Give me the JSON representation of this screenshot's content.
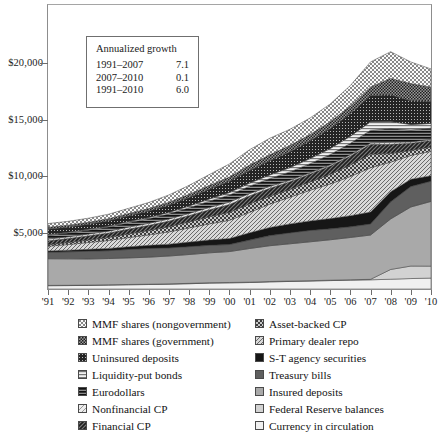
{
  "chart_data": {
    "type": "area",
    "stacked": true,
    "title": "",
    "xlabel": "",
    "ylabel": "",
    "ylim": [
      0,
      25000
    ],
    "ytick_values": [
      5000,
      10000,
      15000,
      20000
    ],
    "ytick_labels": [
      "$5,000",
      "$10,000",
      "$15,000",
      "$20,000"
    ],
    "grid": false,
    "legend_position": "below",
    "x": [
      1991,
      1992,
      1993,
      1994,
      1995,
      1996,
      1997,
      1998,
      1999,
      2000,
      2001,
      2002,
      2003,
      2004,
      2005,
      2006,
      2007,
      2008,
      2009,
      2010
    ],
    "xtick_labels": [
      "'91",
      "'92",
      "'93",
      "'94",
      "'95",
      "'96",
      "'97",
      "'98",
      "'99",
      "'00",
      "'01",
      "'02",
      "'03",
      "'04",
      "'05",
      "'06",
      "'07",
      "'08",
      "'09",
      "'10"
    ],
    "series": [
      {
        "name": "Currency in circulation",
        "pattern": "solid-white",
        "color": "#eeeeee",
        "values": [
          290,
          300,
          320,
          345,
          370,
          395,
          425,
          465,
          520,
          540,
          570,
          625,
          665,
          700,
          740,
          780,
          810,
          860,
          920,
          960
        ]
      },
      {
        "name": "Federal Reserve balances",
        "pattern": "solid-light-gray",
        "color": "#d0d0d0",
        "values": [
          25,
          25,
          25,
          28,
          28,
          28,
          30,
          32,
          35,
          35,
          35,
          35,
          35,
          35,
          35,
          35,
          40,
          860,
          1100,
          1050
        ]
      },
      {
        "name": "Insured deposits",
        "pattern": "solid-gray",
        "color": "#a8a8a8",
        "values": [
          2350,
          2330,
          2300,
          2310,
          2340,
          2380,
          2450,
          2540,
          2630,
          2720,
          2960,
          3150,
          3280,
          3420,
          3560,
          3720,
          3900,
          4450,
          5200,
          5700
        ]
      },
      {
        "name": "Treasury bills",
        "pattern": "solid-dark-gray",
        "color": "#5e5e5e",
        "values": [
          565,
          620,
          680,
          690,
          740,
          760,
          715,
          690,
          660,
          620,
          740,
          890,
          960,
          1000,
          960,
          940,
          970,
          1500,
          1800,
          1780
        ]
      },
      {
        "name": "S-T agency securities",
        "pattern": "solid-black",
        "color": "#1a1a1a",
        "values": [
          120,
          140,
          170,
          200,
          240,
          280,
          330,
          400,
          470,
          530,
          640,
          720,
          790,
          840,
          900,
          980,
          1050,
          900,
          640,
          480
        ]
      },
      {
        "name": "Primary dealer repo",
        "pattern": "diag-hatch-light",
        "color": "#cfcfcf",
        "values": [
          420,
          500,
          600,
          700,
          810,
          920,
          1080,
          1250,
          1420,
          1600,
          1800,
          2050,
          2350,
          2700,
          3050,
          3450,
          3900,
          2600,
          2100,
          2150
        ]
      },
      {
        "name": "Asset-backed CP",
        "pattern": "checker-medium",
        "color": "#b5b5b5",
        "values": [
          130,
          170,
          210,
          260,
          320,
          380,
          450,
          530,
          620,
          700,
          740,
          700,
          680,
          720,
          840,
          1000,
          1200,
          750,
          430,
          380
        ]
      },
      {
        "name": "Financial CP",
        "pattern": "diag-hatch-dark",
        "color": "#606060",
        "values": [
          350,
          360,
          380,
          400,
          430,
          460,
          500,
          560,
          620,
          690,
          720,
          700,
          680,
          700,
          740,
          800,
          870,
          820,
          640,
          570
        ]
      },
      {
        "name": "Nonfinancial CP",
        "pattern": "diag-hatch-xlight",
        "color": "#dcdcdc",
        "values": [
          150,
          150,
          155,
          160,
          170,
          180,
          185,
          190,
          200,
          215,
          200,
          165,
          130,
          110,
          110,
          115,
          120,
          180,
          120,
          100
        ]
      },
      {
        "name": "Eurodollars",
        "pattern": "hlines-dark",
        "color": "#4a4a4a",
        "values": [
          330,
          330,
          340,
          360,
          390,
          410,
          450,
          500,
          560,
          620,
          650,
          690,
          740,
          810,
          900,
          1000,
          1120,
          1200,
          1050,
          980
        ]
      },
      {
        "name": "Liquidity-put bonds",
        "pattern": "hlines-light",
        "color": "#dadada",
        "values": [
          60,
          65,
          70,
          80,
          95,
          110,
          130,
          155,
          185,
          220,
          265,
          315,
          375,
          445,
          530,
          630,
          750,
          620,
          480,
          420
        ]
      },
      {
        "name": "Uninsured deposits",
        "pattern": "dark-dot",
        "color": "#2b2b2b",
        "values": [
          480,
          460,
          450,
          470,
          510,
          560,
          640,
          740,
          860,
          990,
          1120,
          1260,
          1400,
          1560,
          1760,
          2000,
          2300,
          2350,
          2100,
          1950
        ]
      },
      {
        "name": "MMF shares (government)",
        "pattern": "checker-dark",
        "color": "#8a8a8a",
        "values": [
          160,
          165,
          170,
          180,
          195,
          215,
          245,
          285,
          330,
          380,
          470,
          520,
          540,
          560,
          600,
          660,
          760,
          1450,
          1500,
          1250
        ]
      },
      {
        "name": "MMF shares (nongovernment)",
        "pattern": "checker-light",
        "color": "#e6e6e6",
        "values": [
          330,
          340,
          360,
          400,
          460,
          540,
          650,
          790,
          960,
          1150,
          1350,
          1450,
          1430,
          1450,
          1560,
          1800,
          2200,
          2350,
          1900,
          1600
        ]
      }
    ]
  },
  "axes": {
    "y": {
      "ticks": [
        {
          "label": "$20,000",
          "value": 20000
        },
        {
          "label": "$15,000",
          "value": 15000
        },
        {
          "label": "$10,000",
          "value": 10000
        },
        {
          "label": "$5,000",
          "value": 5000
        }
      ]
    },
    "x": {
      "ticks": [
        "'91",
        "'92",
        "'93",
        "'94",
        "'95",
        "'96",
        "'97",
        "'98",
        "'99",
        "'00",
        "'01",
        "'02",
        "'03",
        "'04",
        "'05",
        "'06",
        "'07",
        "'08",
        "'09",
        "'10"
      ]
    }
  },
  "inset": {
    "title": "Annualized growth",
    "rows": [
      {
        "period": "1991–2007",
        "rate": "7.1"
      },
      {
        "period": "2007–2010",
        "rate": "0.1"
      },
      {
        "period": "1991–2010",
        "rate": "6.0"
      }
    ]
  },
  "legend": {
    "left": [
      {
        "label": "MMF shares (nongovernment)",
        "pattern": "checker-light",
        "icon": "legend-swatch-icon"
      },
      {
        "label": "MMF shares (government)",
        "pattern": "checker-dark",
        "icon": "legend-swatch-icon"
      },
      {
        "label": "Uninsured deposits",
        "pattern": "dark-dot",
        "icon": "legend-swatch-icon"
      },
      {
        "label": "Liquidity-put bonds",
        "pattern": "hlines-light",
        "icon": "legend-swatch-icon"
      },
      {
        "label": "Eurodollars",
        "pattern": "hlines-dark",
        "icon": "legend-swatch-icon"
      },
      {
        "label": "Nonfinancial CP",
        "pattern": "diag-hatch-xlight",
        "icon": "legend-swatch-icon"
      },
      {
        "label": "Financial CP",
        "pattern": "diag-hatch-dark",
        "icon": "legend-swatch-icon"
      }
    ],
    "right": [
      {
        "label": "Asset-backed CP",
        "pattern": "checker-medium",
        "icon": "legend-swatch-icon"
      },
      {
        "label": "Primary dealer repo",
        "pattern": "diag-hatch-light",
        "icon": "legend-swatch-icon"
      },
      {
        "label": "S-T agency securities",
        "pattern": "solid-black",
        "icon": "legend-swatch-icon"
      },
      {
        "label": "Treasury bills",
        "pattern": "solid-dark-gray",
        "icon": "legend-swatch-icon"
      },
      {
        "label": "Insured deposits",
        "pattern": "solid-gray",
        "icon": "legend-swatch-icon"
      },
      {
        "label": "Federal Reserve balances",
        "pattern": "solid-light-gray",
        "icon": "legend-swatch-icon"
      },
      {
        "label": "Currency in circulation",
        "pattern": "solid-white",
        "icon": "legend-swatch-icon"
      }
    ]
  }
}
